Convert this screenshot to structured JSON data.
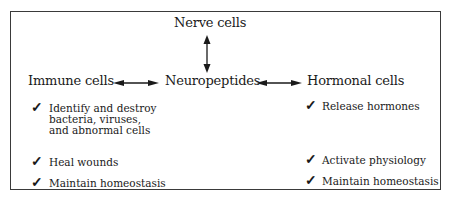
{
  "diagram": {
    "center": "Neuropeptides",
    "top": "Nerve cells",
    "left": "Immune cells",
    "right": "Hormonal cells",
    "check_glyph": "✓",
    "immune_functions": [
      [
        "Identify and destroy",
        "bacteria, viruses,",
        "and abnormal cells"
      ],
      [
        "Heal wounds"
      ],
      [
        "Maintain homeostasis"
      ]
    ],
    "hormonal_functions": [
      [
        "Release hormones"
      ],
      [
        "Activate physiology"
      ],
      [
        "Maintain homeostasis"
      ]
    ],
    "edges": [
      {
        "from": "Nerve cells",
        "to": "Neuropeptides",
        "type": "bidirectional"
      },
      {
        "from": "Immune cells",
        "to": "Neuropeptides",
        "type": "bidirectional"
      },
      {
        "from": "Neuropeptides",
        "to": "Hormonal cells",
        "type": "bidirectional"
      }
    ]
  }
}
